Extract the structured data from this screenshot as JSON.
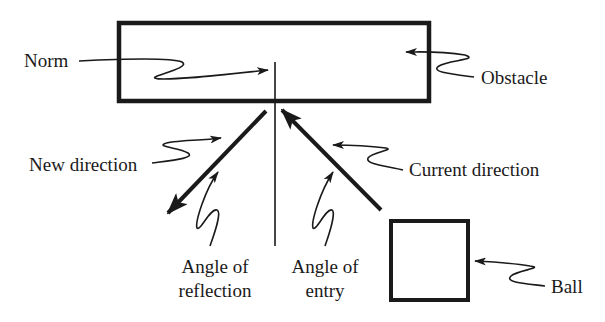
{
  "diagram": {
    "type": "ball-reflection",
    "colors": {
      "ink": "#1a1a1a",
      "background": "#ffffff"
    },
    "labels": {
      "norm": "Norm",
      "obstacle": "Obstacle",
      "new_direction": "New direction",
      "current_direction": "Current direction",
      "angle_reflection_line1": "Angle of",
      "angle_reflection_line2": "reflection",
      "angle_entry_line1": "Angle of",
      "angle_entry_line2": "entry",
      "ball": "Ball"
    },
    "shapes": {
      "obstacle": "rectangle",
      "ball": "square",
      "norm": "vertical line",
      "new_direction": "arrow down-left",
      "current_direction": "arrow up-left"
    }
  }
}
